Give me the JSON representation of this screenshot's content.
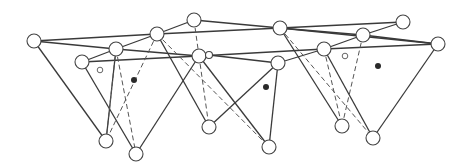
{
  "diagram": {
    "type": "network-graph",
    "colors": {
      "stroke": "#3a3a3a",
      "node_fill": "#ffffff",
      "dot": "#2a2a2a"
    },
    "nodes": [
      {
        "id": "A",
        "x": 34,
        "y": 41,
        "r": 7
      },
      {
        "id": "B",
        "x": 157,
        "y": 34,
        "r": 7
      },
      {
        "id": "C",
        "x": 194,
        "y": 20,
        "r": 7
      },
      {
        "id": "D",
        "x": 280,
        "y": 28,
        "r": 7
      },
      {
        "id": "E",
        "x": 403,
        "y": 22,
        "r": 7
      },
      {
        "id": "F",
        "x": 438,
        "y": 44,
        "r": 7
      },
      {
        "id": "G",
        "x": 116,
        "y": 49,
        "r": 7
      },
      {
        "id": "H",
        "x": 82,
        "y": 62,
        "r": 7
      },
      {
        "id": "I",
        "x": 199,
        "y": 56,
        "r": 7
      },
      {
        "id": "I2",
        "x": 209,
        "y": 55,
        "r": 3.5
      },
      {
        "id": "J",
        "x": 278,
        "y": 63,
        "r": 7
      },
      {
        "id": "K",
        "x": 324,
        "y": 49,
        "r": 7
      },
      {
        "id": "L",
        "x": 363,
        "y": 35,
        "r": 7
      },
      {
        "id": "M",
        "x": 106,
        "y": 141,
        "r": 7
      },
      {
        "id": "N",
        "x": 136,
        "y": 154,
        "r": 7
      },
      {
        "id": "O",
        "x": 209,
        "y": 127,
        "r": 7
      },
      {
        "id": "P",
        "x": 269,
        "y": 147,
        "r": 7
      },
      {
        "id": "Q",
        "x": 342,
        "y": 126,
        "r": 7
      },
      {
        "id": "R",
        "x": 373,
        "y": 138,
        "r": 7
      }
    ],
    "edges": [
      [
        "A",
        "B"
      ],
      [
        "A",
        "G"
      ],
      [
        "B",
        "G"
      ],
      [
        "B",
        "C"
      ],
      [
        "C",
        "D"
      ],
      [
        "B",
        "D"
      ],
      [
        "D",
        "E"
      ],
      [
        "D",
        "L"
      ],
      [
        "E",
        "L"
      ],
      [
        "L",
        "F"
      ],
      [
        "D",
        "F"
      ],
      [
        "G",
        "H"
      ],
      [
        "G",
        "I"
      ],
      [
        "H",
        "I"
      ],
      [
        "I",
        "I2"
      ],
      [
        "I2",
        "J"
      ],
      [
        "I",
        "K"
      ],
      [
        "J",
        "K"
      ],
      [
        "K",
        "L"
      ],
      [
        "K",
        "F"
      ],
      [
        "A",
        "M"
      ],
      [
        "H",
        "N"
      ],
      [
        "I",
        "N"
      ],
      [
        "I",
        "P"
      ],
      [
        "B",
        "O"
      ],
      [
        "O",
        "J"
      ],
      [
        "J",
        "P"
      ],
      [
        "D",
        "Q"
      ],
      [
        "K",
        "R"
      ],
      [
        "F",
        "R"
      ],
      [
        "G",
        "M"
      ]
    ],
    "dashed_edges": [
      [
        "G",
        "M"
      ],
      [
        "G",
        "N"
      ],
      [
        "B",
        "M"
      ],
      [
        "C",
        "I"
      ],
      [
        "I",
        "O"
      ],
      [
        "B",
        "P"
      ],
      [
        "D",
        "R"
      ],
      [
        "L",
        "Q"
      ],
      [
        "K",
        "Q"
      ]
    ],
    "filled_dots": [
      {
        "x": 134,
        "y": 80
      },
      {
        "x": 266,
        "y": 87
      },
      {
        "x": 378,
        "y": 66
      }
    ],
    "hollow_dots": [
      {
        "x": 100,
        "y": 70
      },
      {
        "x": 345,
        "y": 56
      }
    ]
  }
}
